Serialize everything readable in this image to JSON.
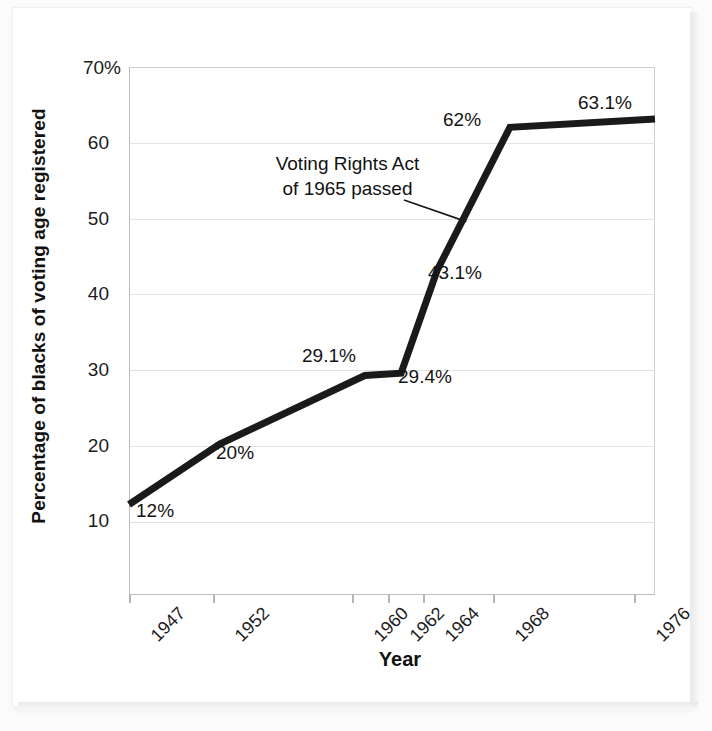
{
  "chart_data": {
    "type": "line",
    "title": "",
    "xlabel": "Year",
    "ylabel": "Percentage of blacks of voting age registered",
    "x": [
      1947,
      1952,
      1960,
      1962,
      1964,
      1968,
      1976
    ],
    "categories": [
      "1947",
      "1952",
      "1960",
      "1962",
      "1964",
      "1968",
      "1976"
    ],
    "values": [
      12,
      20,
      29.1,
      29.4,
      43.1,
      62,
      63.1
    ],
    "point_labels": [
      "12%",
      "20%",
      "29.1%",
      "29.4%",
      "43.1%",
      "62%",
      "63.1%"
    ],
    "ylim": [
      0,
      70
    ],
    "xlim": [
      1947,
      1976
    ],
    "yticks": [
      10,
      20,
      30,
      40,
      50,
      60,
      70
    ],
    "ytick_labels": [
      "10",
      "20",
      "30",
      "40",
      "50",
      "60",
      "70%"
    ],
    "grid": true,
    "legend": false,
    "series_color": "#1a1a1a",
    "grid_color": "#e3e3e3",
    "annotations": [
      {
        "text_line1": "Voting Rights Act",
        "text_line2": "of 1965 passed",
        "points_to_year": 1965.6,
        "points_to_value": 49.5
      }
    ]
  },
  "axes": {
    "y_title": "Percentage of blacks of voting age registered",
    "x_title": "Year",
    "y_ticks": [
      {
        "label": "70%",
        "value": 70
      },
      {
        "label": "60",
        "value": 60
      },
      {
        "label": "50",
        "value": 50
      },
      {
        "label": "40",
        "value": 40
      },
      {
        "label": "30",
        "value": 30
      },
      {
        "label": "20",
        "value": 20
      },
      {
        "label": "10",
        "value": 10
      }
    ],
    "x_ticks": [
      {
        "label": "1947",
        "value": 1947
      },
      {
        "label": "1952",
        "value": 1952
      },
      {
        "label": "1960",
        "value": 1960
      },
      {
        "label": "1962",
        "value": 1962
      },
      {
        "label": "1964",
        "value": 1964
      },
      {
        "label": "1968",
        "value": 1968
      },
      {
        "label": "1976",
        "value": 1976
      }
    ]
  },
  "annotation": {
    "line1": "Voting Rights Act",
    "line2": "of 1965 passed"
  }
}
